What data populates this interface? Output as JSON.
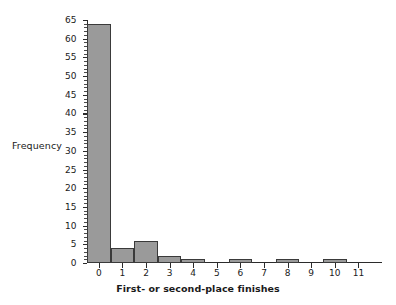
{
  "chart_data": {
    "type": "bar",
    "title": "",
    "subtitle": "",
    "xlabel": "First- or second-place finishes",
    "ylabel": "Frequency",
    "categories": [
      "0",
      "1",
      "2",
      "3",
      "4",
      "5",
      "6",
      "7",
      "8",
      "9",
      "10",
      "11"
    ],
    "values": [
      64,
      4,
      6,
      2,
      1,
      0,
      1,
      0,
      1,
      0,
      1,
      0
    ],
    "xlim": [
      -0.5,
      12.0
    ],
    "ylim": [
      0,
      65
    ],
    "ytick_labels": [
      "0",
      "5",
      "10",
      "15",
      "20",
      "25",
      "30",
      "35",
      "40",
      "45",
      "50",
      "55",
      "60",
      "65"
    ],
    "ytick_values": [
      0,
      5,
      10,
      15,
      20,
      25,
      30,
      35,
      40,
      45,
      50,
      55,
      60,
      65
    ],
    "ytick_minor_step": 1,
    "xtick_labels": [
      "0",
      "1",
      "2",
      "3",
      "4",
      "5",
      "6",
      "7",
      "8",
      "9",
      "10",
      "11"
    ],
    "xtick_values": [
      0,
      1,
      2,
      3,
      4,
      5,
      6,
      7,
      8,
      9,
      10,
      11
    ],
    "grid": false,
    "legend": null,
    "legend_position": "none",
    "annotations": [],
    "colors": {
      "bar_fill": "#9a9a9a",
      "bar_edge": "#3a3a3a",
      "axis": "#2b2b2b",
      "text": "#1a1a1a",
      "background": "#ffffff"
    }
  }
}
